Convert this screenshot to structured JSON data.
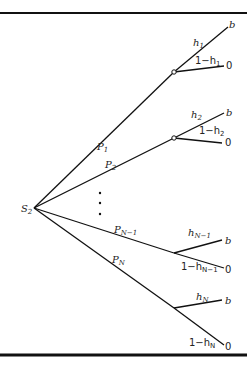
{
  "diagram": {
    "root": {
      "label": "S",
      "sub": "2"
    },
    "branches": [
      {
        "prob": "P",
        "prob_sub": "1",
        "h": "h",
        "h_sub": "1",
        "not_h": "1−h",
        "not_h_sub": "1",
        "success": "b",
        "fail": "0"
      },
      {
        "prob": "P",
        "prob_sub": "2",
        "h": "h",
        "h_sub": "2",
        "not_h": "1−h",
        "not_h_sub": "2",
        "success": "b",
        "fail": "0"
      },
      {
        "prob": "P",
        "prob_sub": "N−1",
        "h": "h",
        "h_sub": "N−1",
        "not_h": "1−h",
        "not_h_sub": "N−1",
        "success": "b",
        "fail": "0"
      },
      {
        "prob": "P",
        "prob_sub": "N",
        "h": "h",
        "h_sub": "N",
        "not_h": "1−h",
        "not_h_sub": "N",
        "success": "b",
        "fail": "0"
      }
    ],
    "ellipsis": "⋮"
  }
}
